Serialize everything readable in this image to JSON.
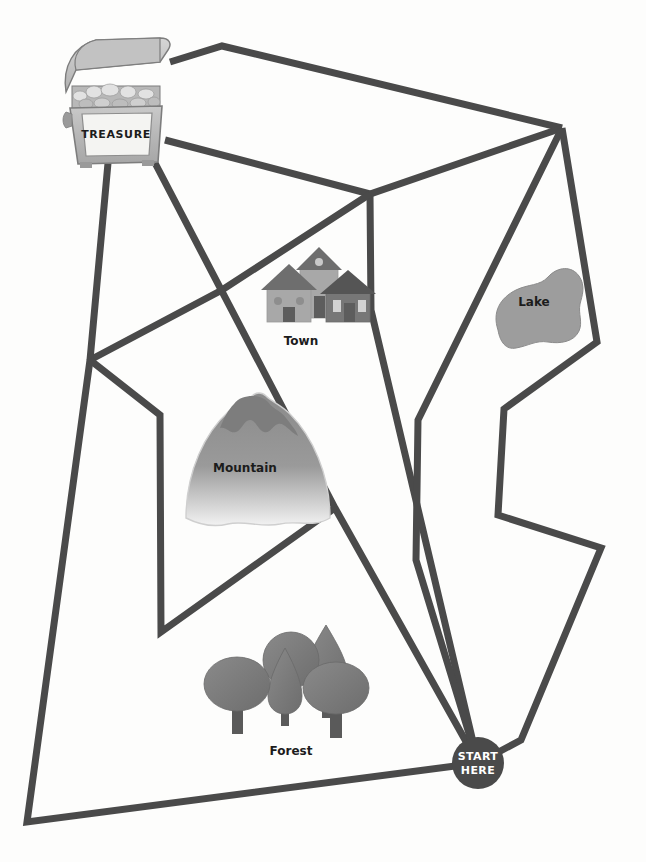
{
  "map": {
    "title": "Treasure Map Maze",
    "background_color": "#fdfdfc",
    "path_color": "#4a4a4a",
    "path_width": 7
  },
  "start_marker": {
    "name": "start-here-marker",
    "line1": "START",
    "line2": "HERE",
    "cx": 478,
    "cy": 763,
    "r": 26,
    "fill": "#4a4a4a",
    "text_color": "#ffffff"
  },
  "landmarks": [
    {
      "id": "treasure",
      "label": "TREASURE",
      "x": 112,
      "y": 110,
      "icon": "treasure-chest-icon",
      "fill": "#b5b5b5"
    },
    {
      "id": "town",
      "label": "Town",
      "label_x": 301,
      "label_y": 345,
      "icon": "town-houses-icon",
      "fill": "#a8a8a8",
      "roof_fill": "#6e6e6e"
    },
    {
      "id": "lake",
      "label": "Lake",
      "label_x": 534,
      "label_y": 306,
      "icon": "lake-icon",
      "fill": "#9d9d9d"
    },
    {
      "id": "mountain",
      "label": "Mountain",
      "label_x": 245,
      "label_y": 472,
      "icon": "mountain-icon",
      "fill": "#8f8f8f"
    },
    {
      "id": "forest",
      "label": "Forest",
      "label_x": 291,
      "label_y": 755,
      "icon": "forest-trees-icon",
      "fill": "#7b7b7b"
    }
  ],
  "paths": [
    {
      "id": "path-chest-top-to-topright",
      "points": "170,62 222,46 562,128"
    },
    {
      "id": "path-chest-right-to-mid",
      "points": "165,140 370,194 562,128"
    },
    {
      "id": "path-midjunction-down",
      "points": "370,194 371,310 478,763"
    },
    {
      "id": "path-mid-to-townleft",
      "points": "370,194 222,290 90,360"
    },
    {
      "id": "path-chest-left-down",
      "points": "108,163 90,360 27,822 478,763"
    },
    {
      "id": "path-chest-right-down",
      "points": "155,163 335,508 478,763"
    },
    {
      "id": "path-left-zig",
      "points": "90,360 160,415 161,632 335,508"
    },
    {
      "id": "path-topright-to-lake-left",
      "points": "562,128 418,420 416,560 478,763"
    },
    {
      "id": "path-right-edge-zig",
      "points": "562,128 597,342 504,409 498,515 601,548 521,740 478,763"
    }
  ],
  "junctions": [
    {
      "id": "junction-top-right",
      "x": 562,
      "y": 128
    },
    {
      "id": "junction-mid-town",
      "x": 370,
      "y": 194
    },
    {
      "id": "junction-left-upper",
      "x": 90,
      "y": 360
    },
    {
      "id": "junction-mid-cross",
      "x": 335,
      "y": 508
    },
    {
      "id": "junction-left-lower",
      "x": 161,
      "y": 632
    },
    {
      "id": "junction-bottom-left",
      "x": 27,
      "y": 822
    }
  ]
}
